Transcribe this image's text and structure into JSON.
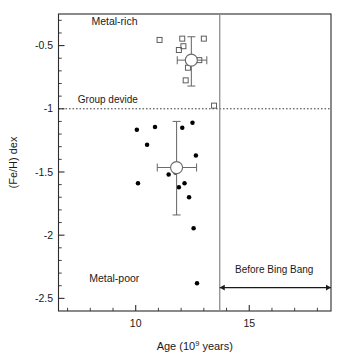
{
  "chart_data": {
    "type": "scatter",
    "title": "",
    "xlabel": "Age (10",
    "xlabel_sup": "9",
    "xlabel_tail": " years)",
    "ylabel": "(Fe/H) dex",
    "xlim": [
      6.6,
      18.6
    ],
    "ylim": [
      -2.6,
      -0.25
    ],
    "xticks_major": [
      10,
      15
    ],
    "xticks_major_labels": [
      "10",
      "15"
    ],
    "xticks_minor": [
      7,
      8,
      9,
      11,
      12,
      13,
      14,
      16,
      17,
      18
    ],
    "yticks_major": [
      -0.5,
      -1,
      -1.5,
      -2,
      -2.5
    ],
    "yticks_major_labels": [
      "-0.5",
      "-1",
      "-1.5",
      "-2",
      "-2.5"
    ],
    "yticks_minor": [
      -0.4,
      -0.3,
      -0.6,
      -0.7,
      -0.8,
      -0.9,
      -1.1,
      -1.2,
      -1.3,
      -1.4,
      -1.6,
      -1.7,
      -1.8,
      -1.9,
      -2.1,
      -2.2,
      -2.3,
      -2.4
    ],
    "grid": false,
    "legend_position": "none",
    "series": [
      {
        "name": "Metal-rich group",
        "marker": "open-square",
        "points": [
          {
            "x": 11.05,
            "y": -0.455
          },
          {
            "x": 12.05,
            "y": -0.445
          },
          {
            "x": 12.1,
            "y": -0.505
          },
          {
            "x": 11.9,
            "y": -0.535
          },
          {
            "x": 13.0,
            "y": -0.445
          },
          {
            "x": 12.8,
            "y": -0.615
          },
          {
            "x": 12.3,
            "y": -0.675
          },
          {
            "x": 12.2,
            "y": -0.775
          },
          {
            "x": 13.45,
            "y": -0.975
          }
        ]
      },
      {
        "name": "Metal-poor group",
        "marker": "filled-circle",
        "points": [
          {
            "x": 10.05,
            "y": -1.165
          },
          {
            "x": 10.85,
            "y": -1.145
          },
          {
            "x": 12.5,
            "y": -1.11
          },
          {
            "x": 12.05,
            "y": -1.15
          },
          {
            "x": 10.5,
            "y": -1.285
          },
          {
            "x": 12.65,
            "y": -1.37
          },
          {
            "x": 11.45,
            "y": -1.52
          },
          {
            "x": 11.75,
            "y": -1.505
          },
          {
            "x": 12.15,
            "y": -1.59
          },
          {
            "x": 11.9,
            "y": -1.62
          },
          {
            "x": 10.1,
            "y": -1.59
          },
          {
            "x": 12.35,
            "y": -1.7
          },
          {
            "x": 12.55,
            "y": -1.945
          },
          {
            "x": 12.7,
            "y": -2.38
          }
        ]
      }
    ],
    "means": [
      {
        "name": "Metal-rich mean",
        "x": 12.45,
        "y": -0.615,
        "xerr_low": 0.62,
        "xerr_high": 0.68,
        "yerr_low": 0.205,
        "yerr_high": 0.185,
        "marker": "open-circle"
      },
      {
        "name": "Metal-poor mean",
        "x": 11.8,
        "y": -1.465,
        "xerr_low": 0.85,
        "xerr_high": 0.88,
        "yerr_low": 0.375,
        "yerr_high": 0.365,
        "marker": "open-circle"
      }
    ],
    "reference_lines": [
      {
        "name": "group-divide",
        "orientation": "horizontal",
        "value": -1.0,
        "style": "dashed",
        "label": "Group devide"
      },
      {
        "name": "big-bang-age",
        "orientation": "vertical",
        "value": 13.7,
        "style": "solid",
        "label": ""
      }
    ],
    "annotations": [
      {
        "name": "metal-rich-label",
        "text": "Metal-rich",
        "x": 8.05,
        "y": -0.34
      },
      {
        "name": "metal-poor-label",
        "text": "Metal-poor",
        "x": 7.95,
        "y": -2.37
      },
      {
        "name": "group-divide-label",
        "text": "Group devide",
        "x": 7.45,
        "y": -0.955
      },
      {
        "name": "before-big-bang-label",
        "text": "Before Bing Bang",
        "x": 16.1,
        "y": -2.3
      }
    ],
    "arrow": {
      "name": "before-big-bang-arrow",
      "x_start": 13.7,
      "x_end": 18.6,
      "y": -2.415,
      "double_headed": true
    },
    "colors": {
      "axis": "#2b2b2b",
      "text": "#1a1a1a",
      "filled_marker": "#000000",
      "open_marker": "#555555",
      "mean_marker": "#6b6b6b",
      "divider": "#3a3a3a",
      "big_bang_line": "#8e8e8e",
      "background": "#ffffff"
    }
  }
}
